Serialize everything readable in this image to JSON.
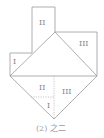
{
  "figure": {
    "caption": "(2) 之二",
    "labels": {
      "top_rect": "II",
      "right_rect": "III",
      "left_step": "I",
      "lower_left": "II",
      "lower_right": "III",
      "lower_center": "I"
    },
    "colors": {
      "line": "#9a9a9a",
      "dotted": "#b0b0b0",
      "text": "#8a8a8a"
    }
  }
}
